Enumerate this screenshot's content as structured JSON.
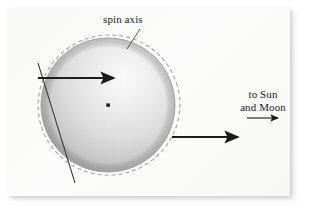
{
  "figure": {
    "title_text": null,
    "background_color": "#fbfbfa",
    "ink_color": "#1b1b1b",
    "labels": {
      "spin_axis": "spin axis",
      "to_sun_line1": "to Sun",
      "to_sun_line2": "and Moon"
    },
    "sphere": {
      "center_x": 108,
      "center_y": 105,
      "radius": 67,
      "fill_light": "#f4f4f4",
      "fill_mid": "#d9d9d9",
      "fill_dark": "#b8b8b8",
      "edge_color": "#9a9a9a"
    },
    "dashed_ellipse": {
      "center_x": 109,
      "center_y": 105,
      "radius_x": 71,
      "radius_y": 70,
      "rotation_deg": -18,
      "stroke_color": "#a8a8a8",
      "dash": "4 3"
    },
    "spin_axis_line": {
      "x1": 38,
      "y1": 63,
      "x2": 75,
      "y2": 183,
      "stroke_color": "#3a3a3a"
    },
    "center_dot": {
      "x": 108,
      "y": 105,
      "size": 3.2,
      "color": "#101010"
    },
    "arrow_upper": {
      "x1": 38,
      "y1": 78,
      "x2": 116,
      "y2": 78,
      "stroke_color": "#1b1b1b",
      "width": 2.2
    },
    "arrow_lower": {
      "x1": 172,
      "y1": 137,
      "x2": 240,
      "y2": 137,
      "stroke_color": "#1b1b1b",
      "width": 2.2
    },
    "arrow_to_sun": {
      "x1": 246,
      "y1": 118,
      "x2": 280,
      "y2": 118,
      "stroke_color": "#1b1b1b",
      "width": 1.1
    },
    "leader_line_spin_axis": {
      "x1": 140,
      "y1": 29,
      "x2": 127,
      "y2": 49,
      "stroke_color": "#4a4a4a"
    }
  }
}
